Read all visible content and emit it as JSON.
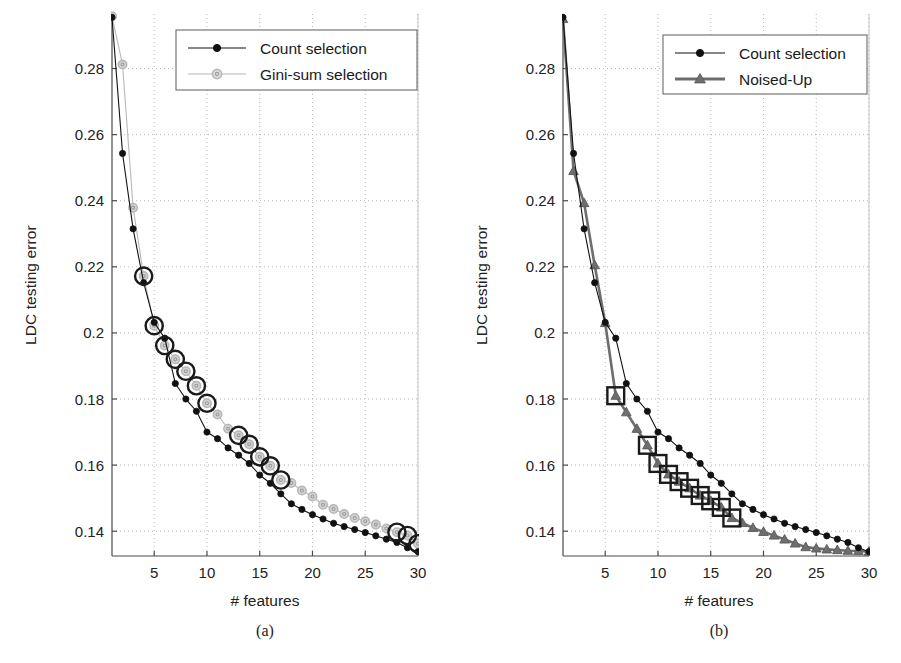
{
  "figure": {
    "panels": [
      {
        "id": "a",
        "caption": "(a)",
        "xlabel": "# features",
        "ylabel": "LDC testing error"
      },
      {
        "id": "b",
        "caption": "(b)",
        "xlabel": "# features",
        "ylabel": "LDC testing error"
      }
    ]
  },
  "chart_data": [
    {
      "type": "line",
      "panel": "a",
      "title": "",
      "xlabel": "# features",
      "ylabel": "LDC testing error",
      "xlim": [
        1,
        30
      ],
      "ylim": [
        0.1325,
        0.2965
      ],
      "xticks": [
        5,
        10,
        15,
        20,
        25,
        30
      ],
      "xticklabels": [
        "5",
        "10",
        "15",
        "20",
        "25",
        "30"
      ],
      "yticks": [
        0.14,
        0.16,
        0.18,
        0.2,
        0.22,
        0.24,
        0.26,
        0.28
      ],
      "yticklabels": [
        "0.14",
        "0.16",
        "0.18",
        "0.2",
        "0.22",
        "0.24",
        "0.26",
        "0.28"
      ],
      "grid": true,
      "legend_position": "top-right",
      "x": [
        1,
        2,
        3,
        4,
        5,
        6,
        7,
        8,
        9,
        10,
        11,
        12,
        13,
        14,
        15,
        16,
        17,
        18,
        19,
        20,
        21,
        22,
        23,
        24,
        25,
        26,
        27,
        28,
        29,
        30
      ],
      "series": [
        {
          "name": "Count selection",
          "color": "#111111",
          "marker": "circle-filled",
          "values": [
            0.2955,
            0.2543,
            0.2315,
            0.2152,
            0.2032,
            0.1984,
            0.1847,
            0.18,
            0.1763,
            0.17,
            0.168,
            0.1652,
            0.163,
            0.1605,
            0.157,
            0.1545,
            0.1513,
            0.1483,
            0.1466,
            0.145,
            0.1437,
            0.1424,
            0.1414,
            0.1405,
            0.1396,
            0.1386,
            0.1376,
            0.1366,
            0.135,
            0.1338
          ]
        },
        {
          "name": "Gini-sum selection",
          "color": "#b8b8b8",
          "marker": "circle-open",
          "values": [
            0.2958,
            0.2812,
            0.2379,
            0.2172,
            0.2022,
            0.1962,
            0.192,
            0.1884,
            0.184,
            0.1787,
            0.1753,
            0.171,
            0.169,
            0.1663,
            0.1625,
            0.1598,
            0.1555,
            0.1546,
            0.1523,
            0.1505,
            0.148,
            0.1467,
            0.1452,
            0.144,
            0.143,
            0.142,
            0.1408,
            0.1397,
            0.1387,
            0.1362
          ]
        }
      ],
      "highlighted_points": {
        "series": "Gini-sum selection",
        "marker": "circle-ring",
        "x": [
          4,
          5,
          6,
          7,
          8,
          9,
          10,
          13,
          14,
          15,
          16,
          17,
          28,
          29,
          30
        ]
      }
    },
    {
      "type": "line",
      "panel": "b",
      "title": "",
      "xlabel": "# features",
      "ylabel": "LDC testing error",
      "xlim": [
        1,
        30
      ],
      "ylim": [
        0.1325,
        0.2965
      ],
      "xticks": [
        5,
        10,
        15,
        20,
        25,
        30
      ],
      "xticklabels": [
        "5",
        "10",
        "15",
        "20",
        "25",
        "30"
      ],
      "yticks": [
        0.14,
        0.16,
        0.18,
        0.2,
        0.22,
        0.24,
        0.26,
        0.28
      ],
      "yticklabels": [
        "0.14",
        "0.16",
        "0.18",
        "0.2",
        "0.22",
        "0.24",
        "0.26",
        "0.28"
      ],
      "grid": true,
      "legend_position": "top-right",
      "x": [
        1,
        2,
        3,
        4,
        5,
        6,
        7,
        8,
        9,
        10,
        11,
        12,
        13,
        14,
        15,
        16,
        17,
        18,
        19,
        20,
        21,
        22,
        23,
        24,
        25,
        26,
        27,
        28,
        29,
        30
      ],
      "series": [
        {
          "name": "Count selection",
          "color": "#111111",
          "marker": "circle-filled",
          "values": [
            0.2955,
            0.2543,
            0.2315,
            0.2152,
            0.2032,
            0.1984,
            0.1847,
            0.18,
            0.1763,
            0.17,
            0.168,
            0.1652,
            0.163,
            0.1605,
            0.157,
            0.1545,
            0.1513,
            0.1483,
            0.1466,
            0.145,
            0.1437,
            0.1424,
            0.1414,
            0.1405,
            0.1396,
            0.1386,
            0.1376,
            0.1366,
            0.135,
            0.1338
          ]
        },
        {
          "name": "Noised-Up",
          "color": "#6e6e6e",
          "marker": "triangle-filled",
          "values": [
            0.295,
            0.249,
            0.2393,
            0.2205,
            0.203,
            0.181,
            0.176,
            0.171,
            0.166,
            0.1605,
            0.1572,
            0.155,
            0.153,
            0.1508,
            0.1492,
            0.1472,
            0.144,
            0.1425,
            0.141,
            0.1398,
            0.1387,
            0.1375,
            0.1363,
            0.1352,
            0.1348,
            0.1345,
            0.1343,
            0.1341,
            0.134,
            0.1338
          ]
        }
      ],
      "highlighted_points": {
        "series": "Noised-Up",
        "marker": "square-ring",
        "x": [
          6,
          9,
          10,
          11,
          12,
          13,
          14,
          15,
          16,
          17
        ]
      }
    }
  ],
  "panel_a": {
    "legend": {
      "items": [
        {
          "label": "Count selection",
          "marker": "circle-filled",
          "color": "#111111"
        },
        {
          "label": "Gini-sum selection",
          "marker": "circle-open",
          "color": "#b8b8b8"
        }
      ]
    },
    "ylabel": "LDC testing error",
    "xlabel": "# features",
    "caption": "(a)",
    "xticklabels": [
      "5",
      "10",
      "15",
      "20",
      "25",
      "30"
    ],
    "yticklabels": [
      "0.14",
      "0.16",
      "0.18",
      "0.2",
      "0.22",
      "0.24",
      "0.26",
      "0.28"
    ]
  },
  "panel_b": {
    "legend": {
      "items": [
        {
          "label": "Count selection",
          "marker": "circle-filled",
          "color": "#111111"
        },
        {
          "label": "Noised-Up",
          "marker": "triangle-filled",
          "color": "#6e6e6e"
        }
      ]
    },
    "ylabel": "LDC testing error",
    "xlabel": "# features",
    "caption": "(b)",
    "xticklabels": [
      "5",
      "10",
      "15",
      "20",
      "25",
      "30"
    ],
    "yticklabels": [
      "0.14",
      "0.16",
      "0.18",
      "0.2",
      "0.22",
      "0.24",
      "0.26",
      "0.28"
    ]
  }
}
